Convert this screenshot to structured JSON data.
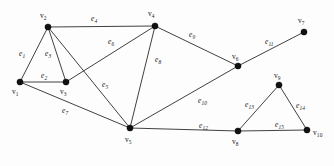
{
  "figure": {
    "type": "undirected-graph-diagram",
    "width": 334,
    "height": 166,
    "background_color": "#fdfdfd",
    "edge_color": "#2b2b2b",
    "vertex_color": "#111111"
  },
  "vertices": [
    {
      "id": "v1",
      "label": "v",
      "sub": "1",
      "x": 20,
      "y": 82,
      "label_x": 12,
      "label_y": 88
    },
    {
      "id": "v2",
      "label": "v",
      "sub": "2",
      "x": 48,
      "y": 27,
      "label_x": 40,
      "label_y": 12
    },
    {
      "id": "v3",
      "label": "v",
      "sub": "3",
      "x": 66,
      "y": 82,
      "label_x": 60,
      "label_y": 88
    },
    {
      "id": "v4",
      "label": "v",
      "sub": "4",
      "x": 155,
      "y": 26,
      "label_x": 148,
      "label_y": 10
    },
    {
      "id": "v5",
      "label": "v",
      "sub": "5",
      "x": 130,
      "y": 128,
      "label_x": 125,
      "label_y": 136
    },
    {
      "id": "v6",
      "label": "v",
      "sub": "6",
      "x": 238,
      "y": 66,
      "label_x": 232,
      "label_y": 53
    },
    {
      "id": "v7",
      "label": "v",
      "sub": "7",
      "x": 304,
      "y": 32,
      "label_x": 298,
      "label_y": 17
    },
    {
      "id": "v8",
      "label": "v",
      "sub": "8",
      "x": 238,
      "y": 131,
      "label_x": 232,
      "label_y": 138
    },
    {
      "id": "v9",
      "label": "v",
      "sub": "9",
      "x": 279,
      "y": 85,
      "label_x": 274,
      "label_y": 72
    },
    {
      "id": "v10",
      "label": "v",
      "sub": "10",
      "x": 307,
      "y": 130,
      "label_x": 313,
      "label_y": 129
    }
  ],
  "edges": [
    {
      "id": "e1",
      "label": "e",
      "sub": "1",
      "from": "v1",
      "to": "v2",
      "label_x": 19,
      "label_y": 50
    },
    {
      "id": "e2",
      "label": "e",
      "sub": "2",
      "from": "v1",
      "to": "v3",
      "label_x": 41,
      "label_y": 72
    },
    {
      "id": "e3",
      "label": "e",
      "sub": "3",
      "from": "v2",
      "to": "v3",
      "label_x": 45,
      "label_y": 50
    },
    {
      "id": "e4",
      "label": "e",
      "sub": "4",
      "from": "v2",
      "to": "v4",
      "label_x": 91,
      "label_y": 15
    },
    {
      "id": "e5",
      "label": "e",
      "sub": "5",
      "from": "v2",
      "to": "v5",
      "label_x": 102,
      "label_y": 81
    },
    {
      "id": "e6",
      "label": "e",
      "sub": "6",
      "from": "v4",
      "to": "v3",
      "label_x": 108,
      "label_y": 38
    },
    {
      "id": "e7",
      "label": "e",
      "sub": "7",
      "from": "v1",
      "to": "v5",
      "label_x": 62,
      "label_y": 107
    },
    {
      "id": "e8",
      "label": "e",
      "sub": "8",
      "from": "v4",
      "to": "v5",
      "label_x": 155,
      "label_y": 56
    },
    {
      "id": "e9",
      "label": "e",
      "sub": "9",
      "from": "v4",
      "to": "v6",
      "label_x": 189,
      "label_y": 31
    },
    {
      "id": "e10",
      "label": "e",
      "sub": "10",
      "from": "v5",
      "to": "v6",
      "label_x": 198,
      "label_y": 97
    },
    {
      "id": "e11",
      "label": "e",
      "sub": "11",
      "from": "v6",
      "to": "v7",
      "label_x": 265,
      "label_y": 38
    },
    {
      "id": "e12",
      "label": "e",
      "sub": "12",
      "from": "v5",
      "to": "v8",
      "label_x": 199,
      "label_y": 122
    },
    {
      "id": "e13",
      "label": "e",
      "sub": "13",
      "from": "v8",
      "to": "v9",
      "label_x": 245,
      "label_y": 101
    },
    {
      "id": "e14",
      "label": "e",
      "sub": "14",
      "from": "v9",
      "to": "v10",
      "label_x": 296,
      "label_y": 102
    },
    {
      "id": "e15",
      "label": "e",
      "sub": "15",
      "from": "v8",
      "to": "v10",
      "label_x": 275,
      "label_y": 121
    }
  ]
}
